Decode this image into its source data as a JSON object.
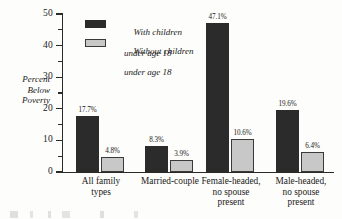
{
  "chart_data": {
    "type": "bar",
    "title": "",
    "xlabel": "",
    "ylabel": "Percent Below Poverty",
    "ylim": [
      0,
      50
    ],
    "ytick_labels": [
      "0",
      "10",
      "20",
      "30",
      "40",
      "50"
    ],
    "ytick_values": [
      0,
      10,
      20,
      30,
      40,
      50
    ],
    "minor_tick_values": [
      5,
      15,
      25,
      35,
      45
    ],
    "grid": false,
    "legend_position": "upper-left-inside",
    "categories": [
      "All family types",
      "Married-couple",
      "Female-headed, no spouse present",
      "Male-headed, no spouse present"
    ],
    "category_lines": [
      [
        "All family",
        "types"
      ],
      [
        "Married-couple"
      ],
      [
        "Female-headed,",
        "no spouse",
        "present"
      ],
      [
        "Male-headed,",
        "no spouse",
        "present"
      ]
    ],
    "series": [
      {
        "name": "With children under age 18",
        "name_lines": [
          "With children",
          "under age 18"
        ],
        "color": "#2b2b2b",
        "values": [
          17.7,
          8.3,
          47.1,
          19.6
        ],
        "labels": [
          "17.7%",
          "8.3%",
          "47.1%",
          "19.6%"
        ]
      },
      {
        "name": "Without children under age 18",
        "name_lines": [
          "Without children",
          "under age 18"
        ],
        "color": "#c8c8c8",
        "values": [
          4.8,
          3.9,
          10.6,
          6.4
        ],
        "labels": [
          "4.8%",
          "3.9%",
          "10.6%",
          "6.4%"
        ]
      }
    ]
  }
}
